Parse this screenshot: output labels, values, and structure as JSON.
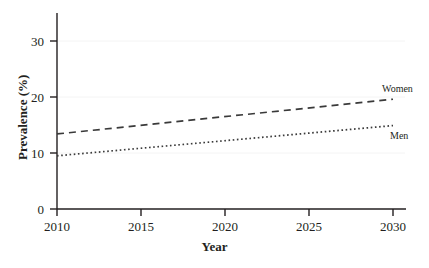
{
  "chart_data": {
    "type": "line",
    "title": "",
    "xlabel": "Year",
    "ylabel": "Prevalence (%)",
    "xlim": [
      2010,
      2030
    ],
    "ylim": [
      0,
      35
    ],
    "xticks": [
      2010,
      2015,
      2020,
      2025,
      2030
    ],
    "xtick_labels": [
      "2010",
      "2015",
      "2020",
      "2025",
      "2030"
    ],
    "yticks": [
      0,
      10,
      20,
      30
    ],
    "ytick_labels": [
      "0",
      "10",
      "20",
      "30"
    ],
    "grid": "horizontal-faint",
    "legend_position": "inline-right-end",
    "x": [
      2010,
      2030
    ],
    "series": [
      {
        "name": "Women",
        "label": "Women",
        "values": [
          13.4,
          19.6
        ],
        "style": "dashed",
        "color": "#3a3a3a"
      },
      {
        "name": "Men",
        "label": "Men",
        "values": [
          9.5,
          14.9
        ],
        "style": "dotted",
        "color": "#3a3a3a"
      }
    ]
  },
  "axes": {
    "x_title": "Year",
    "y_title": "Prevalence (%)",
    "x_tick_labels": [
      "2010",
      "2015",
      "2020",
      "2025",
      "2030"
    ],
    "y_tick_labels": [
      "0",
      "10",
      "20",
      "30"
    ]
  },
  "annotations": {
    "women_label": "Women",
    "men_label": "Men"
  },
  "colors": {
    "axis": "#231f20",
    "series": "#3a3a3a",
    "grid": "#f2f2f2",
    "background": "#ffffff",
    "text": "#231f20"
  }
}
